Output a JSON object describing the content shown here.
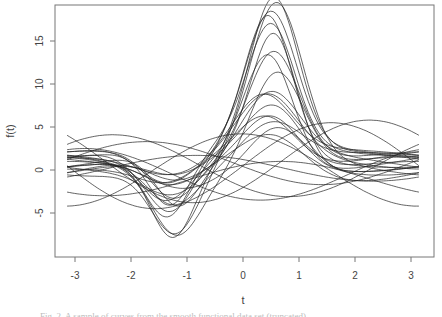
{
  "chart_data": {
    "type": "line",
    "title": "",
    "xlabel": "t",
    "ylabel": "f(t)",
    "xlim": [
      -3.3,
      3.45
    ],
    "ylim": [
      -9.8,
      19.1
    ],
    "x_ticks": [
      -3,
      -2,
      -1,
      0,
      1,
      2,
      3
    ],
    "y_ticks": [
      -5,
      0,
      5,
      10,
      15
    ],
    "grid": false,
    "legend": null,
    "x_domain": [
      -3.14159,
      3.14159
    ],
    "series_params": [
      {
        "name": "c1",
        "peak": 18.0,
        "peak_t": 0.55,
        "width": 0.62,
        "trough": -8.7,
        "trough_t": -1.25,
        "twidth": 0.55,
        "base": 1.5,
        "amp": 0.8,
        "phase": 0.3
      },
      {
        "name": "c2",
        "peak": 17.8,
        "peak_t": 0.6,
        "width": 0.66,
        "trough": -7.8,
        "trough_t": -1.2,
        "twidth": 0.6,
        "base": 0.5,
        "amp": 1.2,
        "phase": 1.1
      },
      {
        "name": "c3",
        "peak": 16.2,
        "peak_t": 0.45,
        "width": 0.6,
        "trough": -7.2,
        "trough_t": -1.35,
        "twidth": 0.55,
        "base": 1.2,
        "amp": 0.9,
        "phase": 2.0
      },
      {
        "name": "c4",
        "peak": 15.8,
        "peak_t": 0.5,
        "width": 0.64,
        "trough": -6.5,
        "trough_t": -1.3,
        "twidth": 0.6,
        "base": 2.0,
        "amp": 0.7,
        "phase": 0.8
      },
      {
        "name": "c5",
        "peak": 15.2,
        "peak_t": 0.55,
        "width": 0.58,
        "trough": -6.0,
        "trough_t": -1.15,
        "twidth": 0.55,
        "base": 0.8,
        "amp": 1.0,
        "phase": 2.7
      },
      {
        "name": "c6",
        "peak": 13.2,
        "peak_t": 0.45,
        "width": 0.62,
        "trough": -5.5,
        "trough_t": -1.4,
        "twidth": 0.65,
        "base": 1.0,
        "amp": 1.1,
        "phase": 3.5
      },
      {
        "name": "c7",
        "peak": 12.8,
        "peak_t": 0.55,
        "width": 0.65,
        "trough": -5.0,
        "trough_t": -1.25,
        "twidth": 0.6,
        "base": 1.6,
        "amp": 0.6,
        "phase": 4.2
      },
      {
        "name": "c8",
        "peak": 12.0,
        "peak_t": 0.6,
        "width": 0.68,
        "trough": -7.0,
        "trough_t": -1.2,
        "twidth": 0.6,
        "base": 0.2,
        "amp": 1.3,
        "phase": 5.0
      },
      {
        "name": "c9",
        "peak": 14.0,
        "peak_t": 0.5,
        "width": 0.6,
        "trough": -6.8,
        "trough_t": -1.3,
        "twidth": 0.55,
        "base": 2.4,
        "amp": 0.8,
        "phase": 1.7
      },
      {
        "name": "c10",
        "peak": 7.5,
        "peak_t": 0.5,
        "width": 0.72,
        "trough": -3.0,
        "trough_t": -1.25,
        "twidth": 0.7,
        "base": 0.8,
        "amp": 1.0,
        "phase": 0.5
      },
      {
        "name": "c11",
        "peak": 7.0,
        "peak_t": 0.45,
        "width": 0.75,
        "trough": -2.5,
        "trough_t": -1.35,
        "twidth": 0.75,
        "base": 1.0,
        "amp": 0.9,
        "phase": 1.4
      },
      {
        "name": "c12",
        "peak": 6.6,
        "peak_t": 0.55,
        "width": 0.7,
        "trough": -2.2,
        "trough_t": -1.2,
        "twidth": 0.7,
        "base": 0.6,
        "amp": 1.2,
        "phase": 2.3
      },
      {
        "name": "c13",
        "peak": 6.2,
        "peak_t": 0.5,
        "width": 0.72,
        "trough": -2.8,
        "trough_t": -1.3,
        "twidth": 0.7,
        "base": 0.4,
        "amp": 0.7,
        "phase": 3.1
      },
      {
        "name": "c14",
        "peak": 5.8,
        "peak_t": 0.4,
        "width": 0.74,
        "trough": -3.5,
        "trough_t": -1.4,
        "twidth": 0.65,
        "base": 1.4,
        "amp": 1.0,
        "phase": 3.9
      },
      {
        "name": "c15",
        "peak": 5.4,
        "peak_t": 0.6,
        "width": 0.7,
        "trough": -2.0,
        "trough_t": -1.15,
        "twidth": 0.75,
        "base": 0.2,
        "amp": 0.8,
        "phase": 4.7
      },
      {
        "name": "c16",
        "peak": 5.0,
        "peak_t": 0.5,
        "width": 0.76,
        "trough": -4.0,
        "trough_t": -1.25,
        "twidth": 0.6,
        "base": 0.9,
        "amp": 1.1,
        "phase": 5.5
      },
      {
        "name": "c17",
        "peak": 6.8,
        "peak_t": 0.35,
        "width": 0.72,
        "trough": -1.8,
        "trough_t": -1.3,
        "twidth": 0.8,
        "base": 1.8,
        "amp": 0.6,
        "phase": 0.1
      },
      {
        "name": "c18",
        "peak": 4.5,
        "peak_t": 0.55,
        "width": 0.8,
        "trough": -2.6,
        "trough_t": -1.2,
        "twidth": 0.7,
        "base": 0.0,
        "amp": 1.4,
        "phase": 2.9
      },
      {
        "name": "s1",
        "peak": 0,
        "peak_t": 0,
        "width": 1,
        "trough": 0,
        "trough_t": 0,
        "twidth": 1,
        "base": 0.5,
        "amp": 5.0,
        "phase": 0.0,
        "freq": 1.0
      },
      {
        "name": "s2",
        "peak": 0,
        "peak_t": 0,
        "width": 1,
        "trough": 0,
        "trough_t": 0,
        "twidth": 1,
        "base": 0.0,
        "amp": 4.2,
        "phase": 1.6,
        "freq": 1.0
      },
      {
        "name": "s3",
        "peak": 0,
        "peak_t": 0,
        "width": 1,
        "trough": 0,
        "trough_t": 0,
        "twidth": 1,
        "base": 0.8,
        "amp": 2.5,
        "phase": 3.3,
        "freq": 1.0
      },
      {
        "name": "s4",
        "peak": 0,
        "peak_t": 0,
        "width": 1,
        "trough": 0,
        "trough_t": 0,
        "twidth": 1,
        "base": -0.5,
        "amp": 3.0,
        "phase": 4.4,
        "freq": 1.0
      },
      {
        "name": "s5",
        "peak": 0,
        "peak_t": 0,
        "width": 1,
        "trough": 0,
        "trough_t": 0,
        "twidth": 1,
        "base": 0.2,
        "amp": 1.5,
        "phase": 2.4,
        "freq": 1.0
      },
      {
        "name": "s6",
        "peak": 0,
        "peak_t": 0,
        "width": 1,
        "trough": 0,
        "trough_t": 0,
        "twidth": 1,
        "base": 1.0,
        "amp": 4.8,
        "phase": 5.6,
        "freq": 1.0
      },
      {
        "name": "s7",
        "peak": 0,
        "peak_t": 0,
        "width": 1,
        "trough": 0,
        "trough_t": 0,
        "twidth": 1,
        "base": -1.0,
        "amp": 2.0,
        "phase": 0.9,
        "freq": 1.0
      },
      {
        "name": "s8",
        "peak": 0,
        "peak_t": 0,
        "width": 1,
        "trough": 0,
        "trough_t": 0,
        "twidth": 1,
        "base": 0.5,
        "amp": 3.6,
        "phase": 3.9,
        "freq": 1.0
      }
    ]
  },
  "axes": {
    "x_label": "t",
    "y_label": "f(t)",
    "x_tick_labels": [
      "-3",
      "-2",
      "-1",
      "0",
      "1",
      "2",
      "3"
    ],
    "y_tick_labels": [
      "-5",
      "0",
      "5",
      "10",
      "15"
    ]
  },
  "caption": "Fig. 2. A sample of curves from the smooth functional data set (truncated)"
}
